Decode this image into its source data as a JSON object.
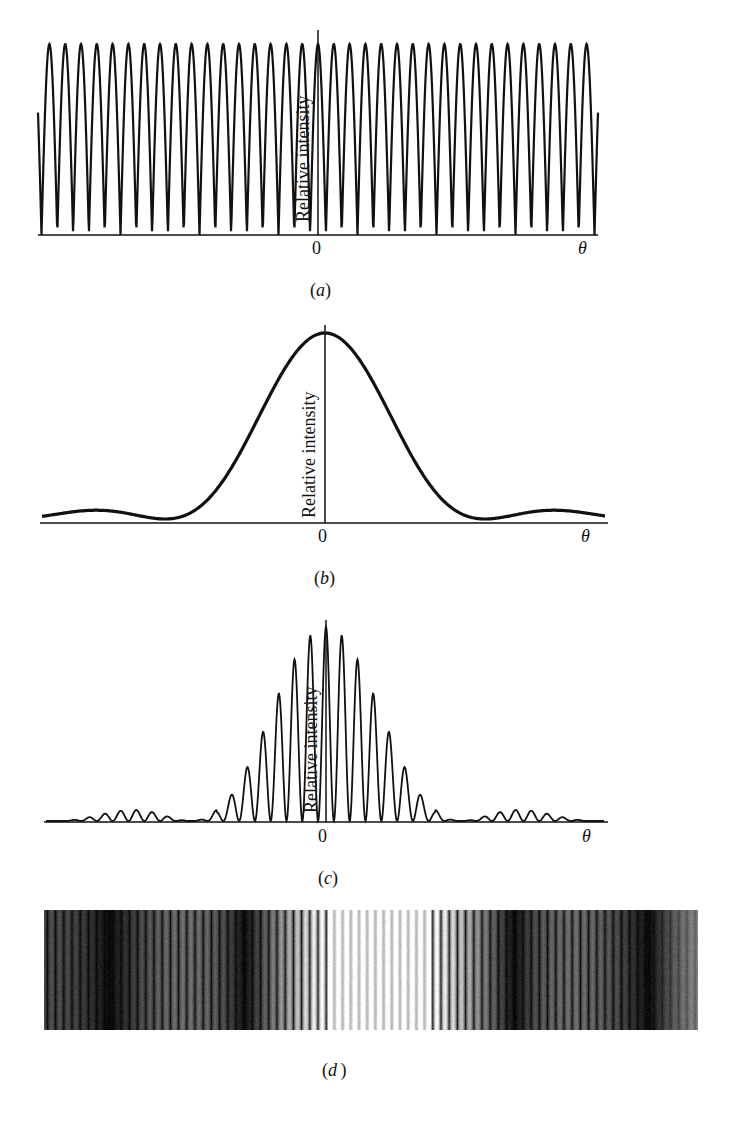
{
  "figure": {
    "panels": [
      {
        "id": "a",
        "caption": "a",
        "ylabel": "Relative intensity",
        "origin_label": "0",
        "xlabel": "θ"
      },
      {
        "id": "b",
        "caption": "b",
        "ylabel": "Relative intensity",
        "origin_label": "0",
        "xlabel": "θ"
      },
      {
        "id": "c",
        "caption": "c",
        "ylabel": "Relative intensity",
        "origin_label": "0",
        "xlabel": "θ"
      },
      {
        "id": "d",
        "caption": "d"
      }
    ],
    "colors": {
      "ink": "#111111",
      "background": "#ffffff"
    }
  },
  "chart_data": [
    {
      "type": "line",
      "panel": "a",
      "title": "",
      "description": "Double-slit interference (cos^2) pattern with equal-height fringes",
      "xlabel": "θ",
      "ylabel": "Relative intensity",
      "x_tick_labels": [
        "0"
      ],
      "fringe_count": 36,
      "fringe_period_px": 15.8,
      "peak_relative_height": 1.0,
      "ylim": [
        0,
        1
      ]
    },
    {
      "type": "line",
      "panel": "b",
      "title": "",
      "description": "Single-slit diffraction envelope (sinc^2) with central maximum and first minima",
      "xlabel": "θ",
      "ylabel": "Relative intensity",
      "x_tick_labels": [
        "0"
      ],
      "central_peak": 1.0,
      "first_minima_relative_x": [
        -0.5,
        0.5
      ],
      "secondary_max_relative_height": 0.047,
      "ylim": [
        0,
        1
      ]
    },
    {
      "type": "line",
      "panel": "c",
      "title": "",
      "description": "Combined double-slit interference modulated by single-slit diffraction envelope",
      "xlabel": "θ",
      "ylabel": "Relative intensity",
      "x_tick_labels": [
        "0"
      ],
      "fringe_peaks_left_to_right": [
        0.02,
        0.04,
        0.08,
        0.14,
        0.25,
        0.39,
        0.56,
        0.73,
        0.88,
        0.98,
        1.0,
        0.98,
        0.88,
        0.73,
        0.56,
        0.39,
        0.25,
        0.14,
        0.08,
        0.04,
        0.02
      ],
      "ylim": [
        0,
        1
      ]
    },
    {
      "type": "heatmap",
      "panel": "d",
      "description": "Photograph of interference fringes: bright central band of many fine fringes, flanked by dark diffraction minima and fainter side bands of fringes",
      "bands_left_to_right": [
        "faint fringes",
        "dark",
        "side band fringes",
        "dark",
        "bright central fringes",
        "dark",
        "side band fringes",
        "dark",
        "faint fringes"
      ]
    }
  ]
}
